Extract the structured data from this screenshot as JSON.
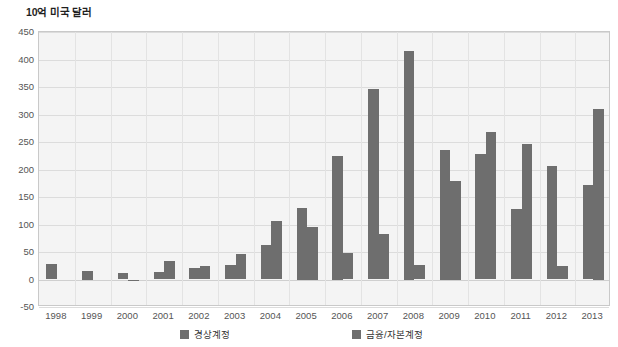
{
  "chart_data": {
    "type": "bar",
    "title": "10억 미국 달러",
    "xlabel": "",
    "ylabel": "10억 미국 달러",
    "grid": true,
    "legend_position": "bottom",
    "ylim": [
      -50,
      450
    ],
    "ytick_step": 50,
    "ytick_labels": [
      "450",
      "400",
      "350",
      "300",
      "250",
      "200",
      "150",
      "100",
      "50",
      "0",
      "-50"
    ],
    "categories": [
      "1998",
      "1999",
      "2000",
      "2001",
      "2002",
      "2003",
      "2004",
      "2005",
      "2006",
      "2007",
      "2008",
      "2009",
      "2010",
      "2011",
      "2012",
      "2013"
    ],
    "series": [
      {
        "name": "경상계정",
        "color": "#6e6e6e",
        "values": [
          28,
          15,
          12,
          13,
          21,
          26,
          62,
          130,
          225,
          347,
          415,
          235,
          228,
          129,
          206,
          172
        ]
      },
      {
        "name": "금융/자본계정",
        "color": "#6e6e6e",
        "values": [
          0,
          0,
          -2,
          34,
          24,
          46,
          107,
          95,
          48,
          82,
          27,
          180,
          268,
          246,
          24,
          310
        ]
      }
    ]
  },
  "legend": {
    "items": [
      {
        "label": "경상계정",
        "swatch": "legend-swatch-current-account"
      },
      {
        "label": "금융/자본계정",
        "swatch": "legend-swatch-financial-capital-account"
      }
    ]
  }
}
